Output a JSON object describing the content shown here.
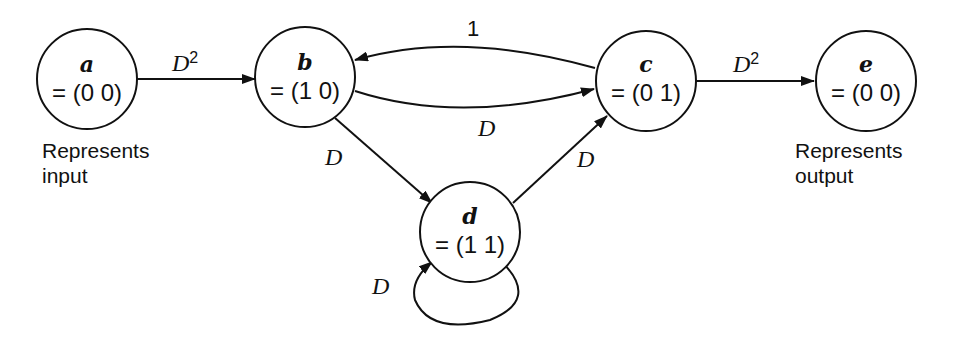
{
  "diagram": {
    "type": "state-transition-diagram",
    "nodes": [
      {
        "id": "a",
        "label": "a",
        "value": "= (0 0)",
        "caption": [
          "Represents",
          "input"
        ]
      },
      {
        "id": "b",
        "label": "b",
        "value": "= (1 0)"
      },
      {
        "id": "c",
        "label": "c",
        "value": "= (0 1)"
      },
      {
        "id": "d",
        "label": "d",
        "value": "= (1 1)"
      },
      {
        "id": "e",
        "label": "e",
        "value": "= (0 0)",
        "caption": [
          "Represents",
          "output"
        ]
      }
    ],
    "edges": [
      {
        "from": "a",
        "to": "b",
        "label": "D",
        "sup": "2"
      },
      {
        "from": "c",
        "to": "b",
        "label": "1",
        "sup": ""
      },
      {
        "from": "b",
        "to": "c",
        "label": "D",
        "sup": ""
      },
      {
        "from": "b",
        "to": "d",
        "label": "D",
        "sup": ""
      },
      {
        "from": "d",
        "to": "c",
        "label": "D",
        "sup": ""
      },
      {
        "from": "d",
        "to": "d",
        "label": "D",
        "sup": ""
      },
      {
        "from": "c",
        "to": "e",
        "label": "D",
        "sup": "2"
      }
    ]
  }
}
